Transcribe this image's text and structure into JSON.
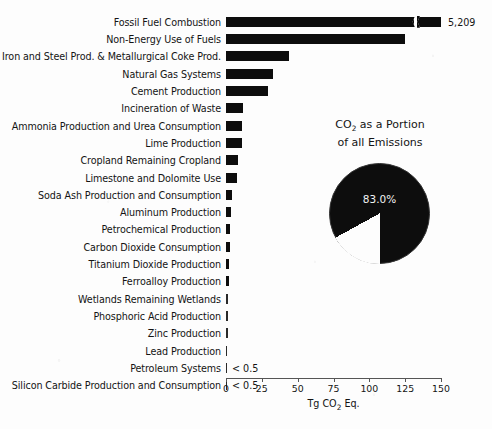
{
  "chart_data": {
    "type": "bar",
    "title": "",
    "xlabel": "Tg CO2 Eq.",
    "ylabel": "",
    "xlim": [
      0,
      150
    ],
    "xticks": [
      0,
      25,
      50,
      75,
      100,
      125,
      150
    ],
    "grid": false,
    "orientation": "horizontal",
    "categories": [
      "Fossil Fuel Combustion",
      "Non-Energy Use of Fuels",
      "Iron and Steel Prod. & Metallurgical Coke Prod.",
      "Natural Gas Systems",
      "Cement Production",
      "Incineration of Waste",
      "Ammonia Production and Urea Consumption",
      "Lime Production",
      "Cropland Remaining Cropland",
      "Limestone and Dolomite Use",
      "Soda Ash Production and Consumption",
      "Aluminum Production",
      "Petrochemical Production",
      "Carbon Dioxide Consumption",
      "Titanium Dioxide Production",
      "Ferroalloy Production",
      "Wetlands Remaining Wetlands",
      "Phosphoric Acid Production",
      "Zinc Production",
      "Lead Production",
      "Petroleum Systems",
      "Silicon Carbide Production and Consumption"
    ],
    "values": [
      5209,
      125,
      44,
      33,
      29,
      12,
      11.5,
      11.5,
      8.5,
      8,
      4.5,
      3.5,
      3,
      2.6,
      2.3,
      2.1,
      1.7,
      1.4,
      1.2,
      0.8,
      0.4,
      0.3
    ],
    "value_labels": [
      "5,209",
      "",
      "",
      "",
      "",
      "",
      "",
      "",
      "",
      "",
      "",
      "",
      "",
      "",
      "",
      "",
      "",
      "",
      "",
      "",
      "< 0.5",
      "< 0.5"
    ],
    "broken_axis_bar_index": 0
  },
  "pie_chart": {
    "type": "pie",
    "title_line1": "CO2 as a Portion",
    "title_line2": "of all Emissions",
    "slices": [
      {
        "label": "CO2",
        "value": 83.0,
        "display": "83.0%",
        "color": "#0d0d0d"
      },
      {
        "label": "Other",
        "value": 17.0,
        "display": "",
        "color": "#ffffff"
      }
    ],
    "center_label": "83.0%"
  },
  "axis": {
    "tick_labels": [
      "0",
      "25",
      "50",
      "75",
      "100",
      "125",
      "150"
    ],
    "title_prefix": "Tg CO",
    "title_sub": "2",
    "title_suffix": " Eq."
  },
  "colors": {
    "bar": "#0d0d0d",
    "background": "#fdfdfd",
    "axis": "#555555",
    "text": "#141414"
  }
}
